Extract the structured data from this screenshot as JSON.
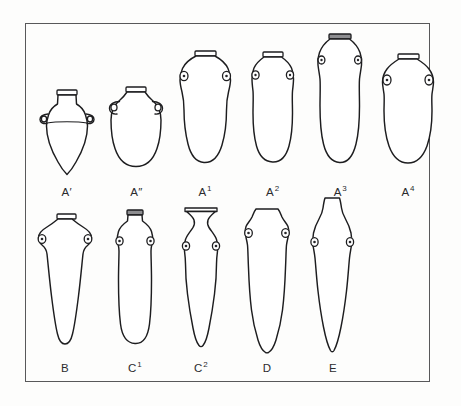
{
  "plate": {
    "background_color": "#fdfdfc",
    "frame_color": "#58585a",
    "ink_color": "#1d1d1f",
    "rim_fill_color": "#8d8d90",
    "caption": ""
  },
  "rows": [
    {
      "name": "row-1",
      "vessels": [
        {
          "id": "a-prime",
          "label_base": "A",
          "label_mark": "′",
          "label_full": "A′",
          "form": "carinated-conical-jar-with-two-handles",
          "width": 48,
          "height": 96
        },
        {
          "id": "a-double-prime",
          "label_base": "A",
          "label_mark": "″",
          "label_full": "A″",
          "form": "globular-jar-with-two-handles",
          "width": 52,
          "height": 96
        },
        {
          "id": "a-1",
          "label_base": "A",
          "label_mark": "1",
          "label_full": "A1",
          "form": "elongated-ovoid-amphora-with-lugs",
          "width": 58,
          "height": 126
        },
        {
          "id": "a-2",
          "label_base": "A",
          "label_mark": "2",
          "label_full": "A2",
          "form": "tapering-ovoid-amphora-with-lugs",
          "width": 52,
          "height": 124
        },
        {
          "id": "a-3",
          "label_base": "A",
          "label_mark": "3",
          "label_full": "A3",
          "form": "tall-narrow-amphora-with-dark-rim",
          "width": 52,
          "height": 140
        },
        {
          "id": "a-4",
          "label_base": "A",
          "label_mark": "4",
          "label_full": "A4",
          "form": "broad-ovoid-amphora-with-lugs",
          "width": 58,
          "height": 124
        }
      ]
    },
    {
      "name": "row-2",
      "vessels": [
        {
          "id": "b",
          "label_base": "B",
          "label_mark": "",
          "label_full": "B",
          "form": "conical-tapering-amphora-round-toe",
          "width": 58,
          "height": 138
        },
        {
          "id": "c-1",
          "label_base": "C",
          "label_mark": "1",
          "label_full": "C1",
          "form": "narrow-cylindrical-bag-amphora",
          "width": 44,
          "height": 140
        },
        {
          "id": "c-2",
          "label_base": "C",
          "label_mark": "2",
          "label_full": "C2",
          "form": "flared-rim-amphora-pointed-toe",
          "width": 48,
          "height": 146
        },
        {
          "id": "d",
          "label_base": "D",
          "label_mark": "",
          "label_full": "D",
          "form": "straight-sided-amphora-pointed-toe",
          "width": 48,
          "height": 146
        },
        {
          "id": "e",
          "label_base": "E",
          "label_mark": "",
          "label_full": "E",
          "form": "spindle-torpedo-amphora-sharp-toe",
          "width": 46,
          "height": 156
        }
      ]
    }
  ]
}
